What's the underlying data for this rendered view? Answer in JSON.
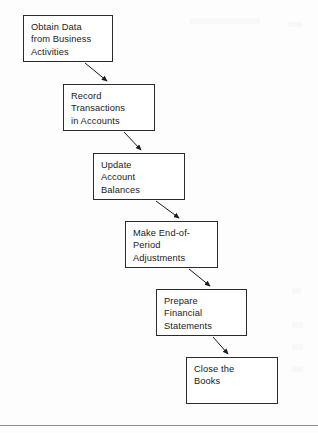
{
  "document": {
    "type": "flowchart-diagram",
    "title": "The Accounting Cycle",
    "orientation": "top-left to bottom-right cascade"
  },
  "colors": {
    "box_border": "#2b2b2b",
    "box_fill": "#ffffff",
    "text": "#1a1a1a",
    "arrow": "#1a1a1a",
    "page_background": "#fdfdfd",
    "rule": "#8e8e8e"
  },
  "flow": {
    "steps": [
      {
        "id": "step-1",
        "label": "Obtain Data\nfrom Business\nActivities",
        "order": "1",
        "x": 23,
        "y": 15,
        "w": 90,
        "h": 47
      },
      {
        "id": "step-2",
        "label": "Record\nTransactions\nin Accounts",
        "order": "2",
        "x": 63,
        "y": 84,
        "w": 92,
        "h": 47
      },
      {
        "id": "step-3",
        "label": "Update\nAccount\nBalances",
        "order": "3",
        "x": 93,
        "y": 153,
        "w": 92,
        "h": 47
      },
      {
        "id": "step-4",
        "label": "Make End-of-\nPeriod\nAdjustments",
        "order": "4",
        "x": 125,
        "y": 221,
        "w": 93,
        "h": 47
      },
      {
        "id": "step-5",
        "label": "Prepare\nFinancial\nStatements",
        "order": "5",
        "x": 156,
        "y": 289,
        "w": 91,
        "h": 47
      },
      {
        "id": "step-6",
        "label": "Close the\nBooks",
        "order": "6",
        "x": 186,
        "y": 357,
        "w": 92,
        "h": 47
      }
    ],
    "connectors": [
      {
        "id": "arrow-1-2",
        "from": "step-1",
        "to": "step-2",
        "x1": 85,
        "y1": 63,
        "x2": 107,
        "y2": 82
      },
      {
        "id": "arrow-2-3",
        "from": "step-2",
        "to": "step-3",
        "x1": 124,
        "y1": 132,
        "x2": 141,
        "y2": 151
      },
      {
        "id": "arrow-3-4",
        "from": "step-3",
        "to": "step-4",
        "x1": 156,
        "y1": 201,
        "x2": 179,
        "y2": 219
      },
      {
        "id": "arrow-4-5",
        "from": "step-4",
        "to": "step-5",
        "x1": 189,
        "y1": 269,
        "x2": 210,
        "y2": 287
      },
      {
        "id": "arrow-5-6",
        "from": "step-5",
        "to": "step-6",
        "x1": 213,
        "y1": 337,
        "x2": 228,
        "y2": 355
      }
    ]
  },
  "page_rule": {
    "label": "page-footer-rule",
    "y": 425
  }
}
